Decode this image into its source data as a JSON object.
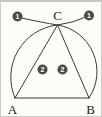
{
  "figure": {
    "labels": {
      "vertex_a": "A",
      "vertex_b": "B",
      "vertex_c": "C"
    },
    "badges": {
      "arc_left_step": "1",
      "arc_right_step": "1",
      "side_left_step": "2",
      "side_right_step": "2"
    },
    "colors": {
      "background": "#fcfcf9",
      "line": "#3a3a3a",
      "badge_fill": "#4a4a4a",
      "badge_text": "#ffffff",
      "label_text": "#222222"
    }
  }
}
